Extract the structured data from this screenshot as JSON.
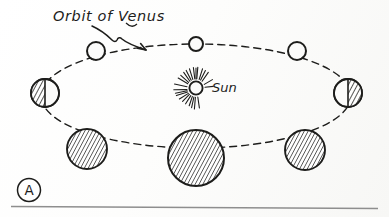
{
  "figure": {
    "panel_label": "A",
    "title_label": "Orbit of Venus",
    "sun_label": "Sun",
    "ink_color": "#1d1d1b",
    "paper_color": "#fbfbfa",
    "baseline_rule_color": "#8e8e8e"
  },
  "chart_data": {
    "type": "diagram",
    "title": "Orbit of Venus",
    "annotations": [
      "Orbit of Venus",
      "Sun",
      "A"
    ],
    "orbit": {
      "shape": "ellipse",
      "style": "dashed",
      "center_x": 196,
      "center_y": 96,
      "radius_x": 155,
      "radius_y": 52
    },
    "sun": {
      "label": "Sun",
      "x": 196,
      "y": 88,
      "core_radius": 6,
      "ray_count": 24,
      "label_x": 212,
      "label_y": 92
    },
    "positions": [
      {
        "name": "superior-conjunction-top-center",
        "x": 196,
        "y": 44,
        "radius": 7,
        "phase": "full",
        "shading": "none"
      },
      {
        "name": "top-left",
        "x": 96,
        "y": 51,
        "radius": 9,
        "phase": "gibbous",
        "shading": "none"
      },
      {
        "name": "top-right",
        "x": 297,
        "y": 51,
        "radius": 9,
        "phase": "gibbous",
        "shading": "none"
      },
      {
        "name": "left-quadrature",
        "x": 45,
        "y": 93,
        "radius": 14,
        "phase": "half",
        "shading": "left-half"
      },
      {
        "name": "right-quadrature",
        "x": 348,
        "y": 93,
        "radius": 14,
        "phase": "half",
        "shading": "right-half"
      },
      {
        "name": "bottom-left",
        "x": 87,
        "y": 149,
        "radius": 20,
        "phase": "crescent",
        "shading": "full"
      },
      {
        "name": "inferior-conjunction-bottom",
        "x": 196,
        "y": 158,
        "radius": 28,
        "phase": "new",
        "shading": "full"
      },
      {
        "name": "bottom-right",
        "x": 305,
        "y": 150,
        "radius": 20,
        "phase": "crescent",
        "shading": "full"
      }
    ],
    "leader": {
      "from_label": "Orbit of Venus",
      "points_to_x": 148,
      "points_to_y": 50
    }
  }
}
